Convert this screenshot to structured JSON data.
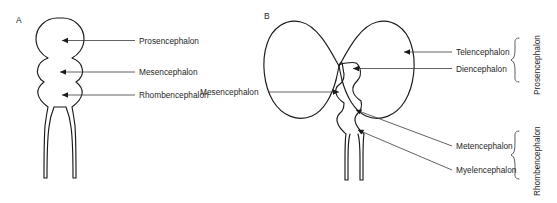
{
  "figure": {
    "background_color": "#ffffff",
    "line_color": "#1a1a1a",
    "leader_color": "#3a3a3a"
  },
  "panels": [
    {
      "letter": "A",
      "description": "three-vesicle stage neural tube",
      "labels": [
        {
          "name": "prosencephalon",
          "text": "Prosencephalon"
        },
        {
          "name": "mesencephalon",
          "text": "Mesencephalon"
        },
        {
          "name": "rhombencephalon",
          "text": "Rhombencephalon"
        }
      ]
    },
    {
      "letter": "B",
      "description": "five-vesicle stage brain with cerebral hemispheres",
      "labels": [
        {
          "name": "telencephalon",
          "text": "Telencephalon"
        },
        {
          "name": "diencephalon",
          "text": "Diencephalon"
        },
        {
          "name": "mesencephalon",
          "text": "Mesencephalon"
        },
        {
          "name": "metencephalon",
          "text": "Metencephalon"
        },
        {
          "name": "myelencephalon",
          "text": "Myelencephalon"
        }
      ],
      "brackets": [
        {
          "name": "prosencephalon",
          "text": "Prosencephalon"
        },
        {
          "name": "rhombencephalon",
          "text": "Rhombencephalon"
        }
      ]
    }
  ]
}
